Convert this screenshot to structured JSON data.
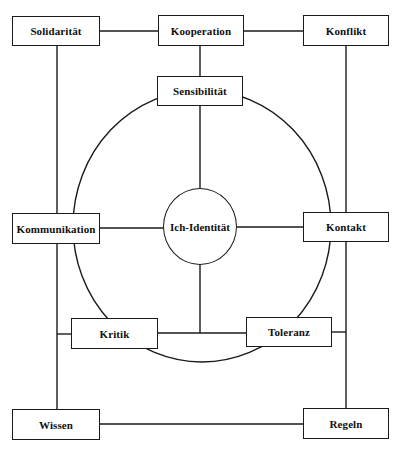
{
  "diagram": {
    "title": "",
    "colors": {
      "line": "#1a1a1a",
      "background": "#ffffff",
      "text": "#111111"
    },
    "center": {
      "label": "Ich-Identität"
    },
    "nodes": {
      "solidaritaet": "Solidarität",
      "kooperation": "Kooperation",
      "konflikt": "Konflikt",
      "sensibilitaet": "Sensibilität",
      "kommunikation": "Kommunikation",
      "kontakt": "Kontakt",
      "kritik": "Kritik",
      "toleranz": "Toleranz",
      "wissen": "Wissen",
      "regeln": "Regeln"
    },
    "edges": [
      [
        "Solidarität",
        "Kooperation"
      ],
      [
        "Kooperation",
        "Konflikt"
      ],
      [
        "Kooperation",
        "Sensibilität"
      ],
      [
        "Sensibilität",
        "Ich-Identität"
      ],
      [
        "Kommunikation",
        "Ich-Identität"
      ],
      [
        "Ich-Identität",
        "Kontakt"
      ],
      [
        "Ich-Identität",
        "Kritik-Toleranz-Verbindung"
      ],
      [
        "Kritik",
        "Toleranz"
      ],
      [
        "Solidarität",
        "Kommunikation"
      ],
      [
        "Kommunikation",
        "Wissen"
      ],
      [
        "Konflikt",
        "Kontakt"
      ],
      [
        "Kontakt",
        "Regeln"
      ],
      [
        "Wissen",
        "Regeln"
      ]
    ]
  }
}
